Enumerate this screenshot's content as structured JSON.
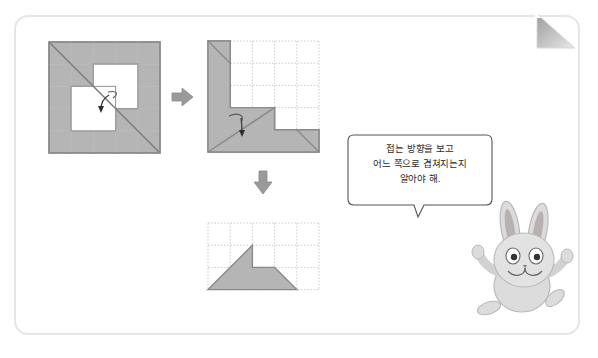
{
  "page": {
    "background_color": "#ffffff",
    "frame_border_color": "#e6e6e6",
    "corner_fold_color": "#9e9e9e",
    "shape_fill_color": "#b5b5b5",
    "shape_stroke_color": "#8a8a8a",
    "grid_line_color": "#c8c8c8",
    "arrow_color": "#8e8e8e",
    "fold_arrow_color": "#4a4a4a",
    "character_color": "#d9d9d9"
  },
  "figures": [
    {
      "id": "figure-1",
      "name": "folded-paper-step-1",
      "description": "5x5 grid square, shaded, with two white square holes and a diagonal fold line from top-left to bottom-right",
      "grid_columns": 5,
      "grid_rows": 5,
      "diagonal": "top-left to bottom-right",
      "holes": [
        {
          "col": 2,
          "row": 2
        },
        {
          "col": 3,
          "row": 3
        }
      ],
      "fold_arrow": {
        "direction": "down",
        "label": "fold-indicator"
      }
    },
    {
      "id": "figure-2",
      "name": "folded-paper-step-2",
      "description": "Result after first fold: stair-step shaded polygon with diagonal, inside a 5x5 grid",
      "grid_columns": 5,
      "grid_rows": 5,
      "fold_arrow": {
        "direction": "down",
        "label": "fold-indicator"
      }
    },
    {
      "id": "figure-3",
      "name": "folded-paper-step-3",
      "description": "Final result: shaded trapezoid shape with a rectangular notch, inside a 5x3 grid",
      "grid_columns": 5,
      "grid_rows": 3
    }
  ],
  "arrows": [
    {
      "id": "arrow-right",
      "name": "right-arrow",
      "direction": "right"
    },
    {
      "id": "arrow-down",
      "name": "down-arrow",
      "direction": "down"
    }
  ],
  "speech_bubble": {
    "name": "speech-bubble",
    "lines": [
      "접는 방향을 보고",
      "어느 쪽으로 겹쳐지는지",
      "알아야 해."
    ],
    "line1": "접는 방향을 보고",
    "line2": "어느 쪽으로 겹쳐지는지",
    "line3": "알아야 해."
  },
  "character": {
    "name": "rabbit-character",
    "type": "rabbit",
    "pose": "arms-raised"
  }
}
